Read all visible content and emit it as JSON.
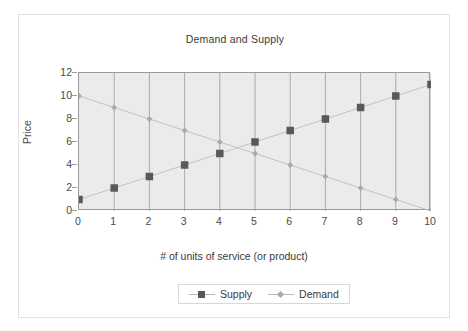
{
  "chart_data": {
    "type": "line",
    "title": "Demand and Supply",
    "xlabel": "# of units of service (or product)",
    "ylabel": "Price",
    "x": [
      0,
      1,
      2,
      3,
      4,
      5,
      6,
      7,
      8,
      9,
      10
    ],
    "xlim": [
      0,
      10
    ],
    "ylim": [
      0,
      12
    ],
    "xticks": [
      "0",
      "1",
      "2",
      "3",
      "4",
      "5",
      "6",
      "7",
      "8",
      "9",
      "10"
    ],
    "yticks": [
      "0",
      "2",
      "4",
      "6",
      "8",
      "10",
      "12"
    ],
    "grid": "vertical",
    "legend_position": "bottom",
    "series": [
      {
        "name": "Supply",
        "marker": "square",
        "color": "#595959",
        "values": [
          1,
          2,
          3,
          4,
          5,
          6,
          7,
          8,
          9,
          10,
          11
        ]
      },
      {
        "name": "Demand",
        "marker": "diamond",
        "color": "#a9a9a9",
        "values": [
          10,
          9,
          8,
          7,
          6,
          5,
          4,
          3,
          2,
          1,
          0
        ]
      }
    ]
  },
  "colors": {
    "plot_background": "#ebebeb",
    "plot_border": "#9a9a9a",
    "gridline": "#9a9a9a",
    "frame_border": "#e2e2e2",
    "text": "#3a3a3a",
    "supply": "#595959",
    "demand": "#a9a9a9"
  },
  "legend": {
    "items": [
      {
        "label": "Supply"
      },
      {
        "label": "Demand"
      }
    ]
  }
}
